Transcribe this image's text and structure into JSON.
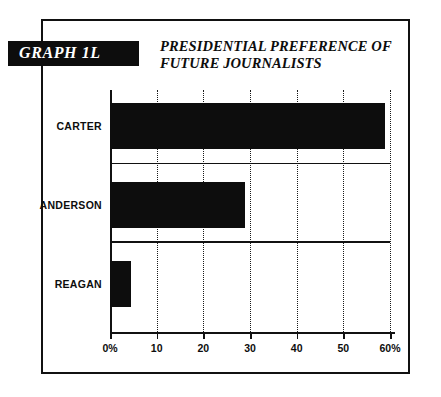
{
  "banner": {
    "label": "GRAPH 1L"
  },
  "chart_data": {
    "type": "bar",
    "orientation": "horizontal",
    "title": "PRESIDENTIAL PREFERENCE OF\nFUTURE JOURNALISTS",
    "categories": [
      "CARTER",
      "ANDERSON",
      "REAGAN"
    ],
    "values": [
      59,
      29,
      4.5
    ],
    "series": [
      {
        "name": "Presidential preference",
        "values": [
          59,
          29,
          4.5
        ]
      }
    ],
    "xlabel": "",
    "ylabel": "",
    "xlim": [
      0,
      60
    ],
    "xticks": [
      0,
      10,
      20,
      30,
      40,
      50,
      60
    ],
    "xtick_labels": [
      "0%",
      "10",
      "20",
      "30",
      "40",
      "50",
      "60%"
    ],
    "grid": "vertical-dotted",
    "legend": "none",
    "bar_color": "#0d0d0d",
    "background_color": "#ffffff",
    "frame_color": "#111111"
  }
}
